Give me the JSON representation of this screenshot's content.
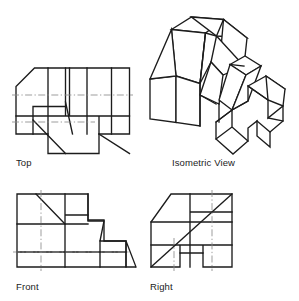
{
  "document": {
    "title": "Orthographic Projection Multiview Drawing",
    "kind": "engineering-drawing",
    "background_color": "#ffffff",
    "line_color": "#1c1c1c",
    "center_line_color": "#8c8c8c"
  },
  "views": {
    "top": {
      "label": "Top",
      "label_x": 16,
      "label_y": 166,
      "description": "Top orthographic view with chamfered upper-left corner, narrow vertical slots and two diagonal edges"
    },
    "isometric": {
      "label": "Isometric View",
      "label_x": 172,
      "label_y": 166,
      "description": "Pictorial isometric representation of the part"
    },
    "front": {
      "label": "Front",
      "label_x": 16,
      "label_y": 290,
      "description": "Front orthographic view with stepped profile and inclined surfaces"
    },
    "right": {
      "label": "Right",
      "label_x": 150,
      "label_y": 290,
      "description": "Right side orthographic view with inclined surface and bottom notch"
    }
  },
  "labels": [
    {
      "name": "top",
      "text": "Top"
    },
    {
      "name": "isometric",
      "text": "Isometric View"
    },
    {
      "name": "front",
      "text": "Front"
    },
    {
      "name": "right",
      "text": "Right"
    }
  ]
}
